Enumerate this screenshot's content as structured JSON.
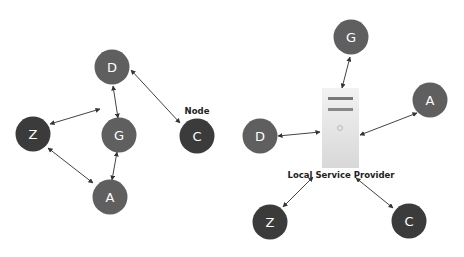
{
  "colors": {
    "node_light": "#5f5f5f",
    "node_dark": "#3b3b3b",
    "edge": "#444444",
    "server": "#e4e4e4"
  },
  "left_diagram": {
    "annotation": "Node",
    "nodes": [
      {
        "id": "D",
        "label": "D",
        "shade": "light"
      },
      {
        "id": "G",
        "label": "G",
        "shade": "light"
      },
      {
        "id": "Z",
        "label": "Z",
        "shade": "dark"
      },
      {
        "id": "C",
        "label": "C",
        "shade": "dark"
      },
      {
        "id": "A",
        "label": "A",
        "shade": "light"
      }
    ],
    "edges": [
      [
        "D",
        "Z"
      ],
      [
        "D",
        "G"
      ],
      [
        "D",
        "C"
      ],
      [
        "Z",
        "A"
      ],
      [
        "G",
        "A"
      ]
    ]
  },
  "right_diagram": {
    "server_caption": "Local Service Provider",
    "nodes": [
      {
        "id": "G",
        "label": "G",
        "shade": "light"
      },
      {
        "id": "A",
        "label": "A",
        "shade": "light"
      },
      {
        "id": "D",
        "label": "D",
        "shade": "light"
      },
      {
        "id": "Z",
        "label": "Z",
        "shade": "dark"
      },
      {
        "id": "C",
        "label": "C",
        "shade": "dark"
      }
    ],
    "edges": [
      [
        "server",
        "G"
      ],
      [
        "server",
        "A"
      ],
      [
        "server",
        "D"
      ],
      [
        "server",
        "Z"
      ],
      [
        "server",
        "C"
      ]
    ]
  }
}
